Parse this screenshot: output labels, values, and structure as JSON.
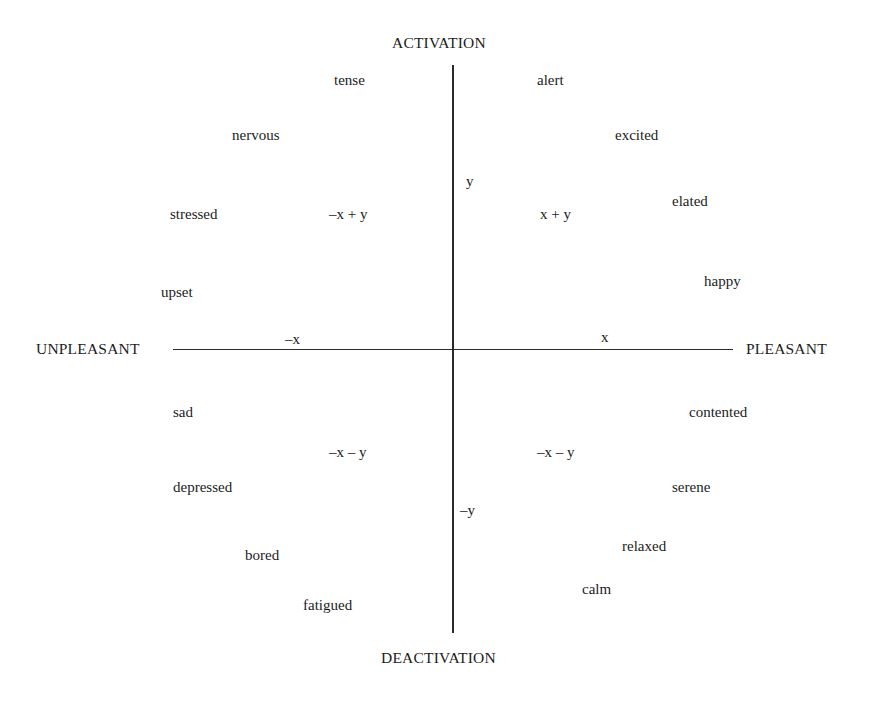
{
  "diagram": {
    "type": "circumplex-model-of-affect",
    "axes": {
      "vertical": {
        "top_label": "ACTIVATION",
        "bottom_label": "DEACTIVATION",
        "positive_symbol": "y",
        "negative_symbol": "–y"
      },
      "horizontal": {
        "left_label": "UNPLEASANT",
        "right_label": "PLEASANT",
        "positive_symbol": "x",
        "negative_symbol": "–x"
      }
    },
    "quadrant_labels": {
      "upper_left": "–x + y",
      "upper_right": "x + y",
      "lower_left": "–x – y",
      "lower_right": "–x – y"
    },
    "affect_words": {
      "tense": "tense",
      "nervous": "nervous",
      "stressed": "stressed",
      "upset": "upset",
      "alert": "alert",
      "excited": "excited",
      "elated": "elated",
      "happy": "happy",
      "sad": "sad",
      "depressed": "depressed",
      "bored": "bored",
      "fatigued": "fatigued",
      "contented": "contented",
      "serene": "serene",
      "relaxed": "relaxed",
      "calm": "calm"
    },
    "colors": {
      "background": "#ffffff",
      "text": "#1c1c1c",
      "axis": "#2a2a2a"
    }
  }
}
